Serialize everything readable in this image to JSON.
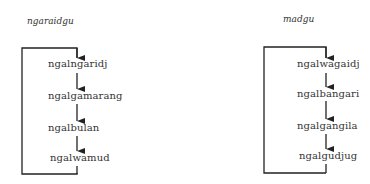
{
  "diagrams": [
    {
      "title": "ngaraidgu",
      "cycle": [
        "ngalngaridj",
        "ngalgamarang",
        "ngalbulan",
        "ngalwamud"
      ]
    },
    {
      "title": "madgu",
      "cycle": [
        "ngalwagaidj",
        "ngalbangari",
        "ngalgangila",
        "ngalgudjug"
      ]
    }
  ]
}
